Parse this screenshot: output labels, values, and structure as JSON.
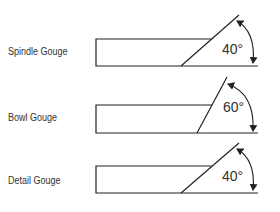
{
  "diagram": {
    "line_color": "#222222",
    "text_color": "#333333",
    "gouges": [
      {
        "name": "Spindle Gouge",
        "angle_label": "40°",
        "angle_deg": 40,
        "label_pos": {
          "x": 8,
          "y": 46
        },
        "rect": {
          "x1": 96,
          "y_top": 39,
          "y_bottom": 66,
          "x_top_end": 212
        },
        "bevel": {
          "x_base": 181,
          "x_tip": 239,
          "y_tip": 15
        },
        "baseline_end": 258,
        "angle_text_pos": {
          "x": 222,
          "y": 54
        },
        "arc": {
          "x_start": 237,
          "y_start": 21,
          "x_end": 253,
          "y_end": 63,
          "cx": 256,
          "cy": 32
        }
      },
      {
        "name": "Bowl Gouge",
        "angle_label": "60°",
        "angle_deg": 60,
        "label_pos": {
          "x": 8,
          "y": 112
        },
        "rect": {
          "x1": 96,
          "y_top": 105,
          "y_bottom": 133,
          "x_top_end": 212
        },
        "bevel": {
          "x_base": 197,
          "x_tip": 227,
          "y_tip": 77
        },
        "baseline_end": 258,
        "angle_text_pos": {
          "x": 223,
          "y": 112
        },
        "arc": {
          "x_start": 228,
          "y_start": 84,
          "x_end": 253,
          "y_end": 131,
          "cx": 255,
          "cy": 94
        }
      },
      {
        "name": "Detail Gouge",
        "angle_label": "40°",
        "angle_deg": 40,
        "label_pos": {
          "x": 8,
          "y": 175
        },
        "rect": {
          "x1": 96,
          "y_top": 166,
          "y_bottom": 193,
          "x_top_end": 212
        },
        "bevel": {
          "x_base": 181,
          "x_tip": 239,
          "y_tip": 143
        },
        "baseline_end": 258,
        "angle_text_pos": {
          "x": 222,
          "y": 181
        },
        "arc": {
          "x_start": 237,
          "y_start": 149,
          "x_end": 253,
          "y_end": 190,
          "cx": 256,
          "cy": 160
        }
      }
    ]
  }
}
